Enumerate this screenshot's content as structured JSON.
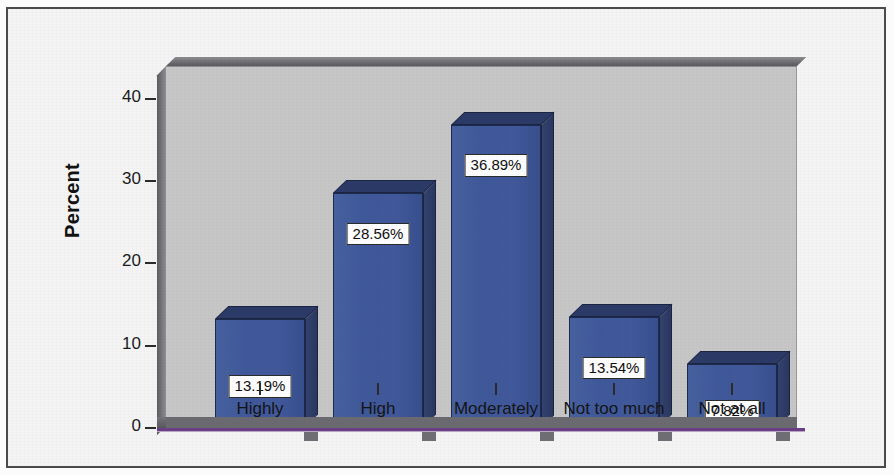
{
  "chart_data": {
    "type": "bar",
    "title": "",
    "subtitle": "",
    "xlabel": "",
    "ylabel": "Percent",
    "categories": [
      "Highly",
      "High",
      "Moderately",
      "Not too much",
      "Not at all"
    ],
    "values": [
      13.19,
      28.56,
      36.89,
      13.54,
      7.82
    ],
    "data_labels": [
      "13.19%",
      "28.56%",
      "36.89%",
      "13.54%",
      "7.82%"
    ],
    "ylim": [
      0,
      44
    ],
    "yticks": [
      0,
      10,
      20,
      30,
      40
    ],
    "ytick_labels": [
      "0",
      "10",
      "20",
      "30",
      "40"
    ],
    "grid": false,
    "legend": null,
    "style": "3d-bars",
    "colors": {
      "bar_front": "#41599b",
      "bar_top": "#2c3a68",
      "bar_side": "#2f3f6a",
      "bar_outline": "#1b2442",
      "plot_background": "#c6c6c6",
      "wall_shadow": "#6f6f73",
      "floor": "#6a6a70",
      "baseline": "#6b3f86",
      "page_background": "#f4f4f5",
      "frame_border": "#4a4a4d",
      "label_box_fill": "#fdfdfd",
      "label_box_border": "#2a2a2a",
      "text": "#141414"
    }
  }
}
